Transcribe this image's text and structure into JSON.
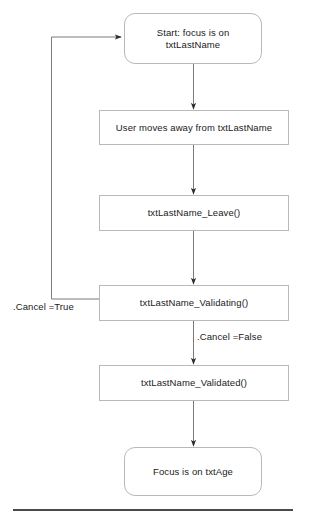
{
  "diagram": {
    "nodes": [
      {
        "id": "start",
        "label": "Start: focus is on txtLastName",
        "shape": "terminator"
      },
      {
        "id": "moveaway",
        "label": "User moves away from txtLastName",
        "shape": "process"
      },
      {
        "id": "leave",
        "label": "txtLastName_Leave()",
        "shape": "process"
      },
      {
        "id": "validating",
        "label": "txtLastName_Validating()",
        "shape": "process"
      },
      {
        "id": "validated",
        "label": "txtLastName_Validated()",
        "shape": "process"
      },
      {
        "id": "end",
        "label": "Focus is on txtAge",
        "shape": "terminator"
      }
    ],
    "edge_labels": {
      "cancel_true": ".Cancel =True",
      "cancel_false": ".Cancel =False"
    }
  },
  "colors": {
    "node_border": "#b9b9b9",
    "node_fill": "#ffffff",
    "connector": "#6f6f6f",
    "text": "#1a1a1a",
    "rule": "#4a4a4a"
  }
}
